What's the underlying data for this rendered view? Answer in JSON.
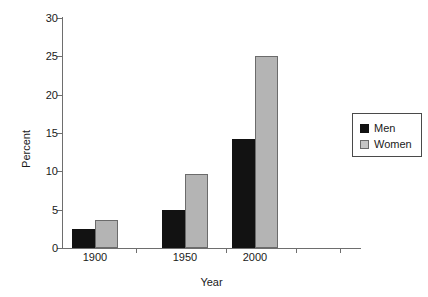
{
  "chart_data": {
    "type": "bar",
    "title": "",
    "xlabel": "Year",
    "ylabel": "Percent",
    "categories": [
      "1900",
      "1950",
      "2000"
    ],
    "series": [
      {
        "name": "Men",
        "values": [
          2.5,
          4.9,
          14.2
        ],
        "color": "#121212"
      },
      {
        "name": "Women",
        "values": [
          3.7,
          9.7,
          25.0
        ],
        "color": "#b4b4b4"
      }
    ],
    "ylim": [
      0,
      30
    ],
    "yticks": [
      0,
      5,
      10,
      15,
      20,
      25,
      30
    ],
    "ytick_labels": [
      "0",
      "5",
      "10",
      "15",
      "20",
      "25",
      "30"
    ],
    "grid": false,
    "legend_position": "right",
    "legend_entries": [
      "Men",
      "Women"
    ]
  },
  "axes": {
    "y_title": "Percent",
    "x_title": "Year",
    "y_labels": {
      "t0": "0",
      "t5": "5",
      "t10": "10",
      "t15": "15",
      "t20": "20",
      "t25": "25",
      "t30": "30"
    },
    "x_labels": {
      "c0": "1900",
      "c1": "1950",
      "c2": "2000"
    }
  },
  "legend": {
    "men_label": "Men",
    "women_label": "Women"
  }
}
